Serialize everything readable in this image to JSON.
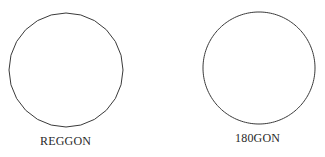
{
  "figures": [
    {
      "label": "REGGON",
      "shape": "polygon",
      "sides": 24,
      "center": [
        66,
        70
      ],
      "radius": 57,
      "stroke": "#3a3a3a"
    },
    {
      "label": "180GON",
      "shape": "polygon",
      "sides": 180,
      "center": [
        259,
        68
      ],
      "radius": 56,
      "stroke": "#3a3a3a"
    }
  ],
  "background": "#ffffff"
}
